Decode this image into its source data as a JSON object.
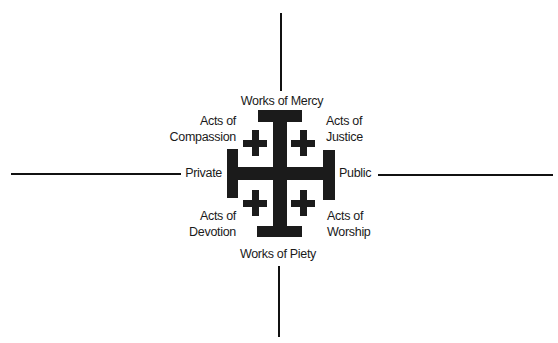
{
  "diagram": {
    "title": "",
    "colors": {
      "ink": "#1b1b1b",
      "background": "#ffffff"
    },
    "axes": {
      "vertical_top_label": "Works of Mercy",
      "vertical_bottom_label": "Works of Piety",
      "horizontal_left_label": "Private",
      "horizontal_right_label": "Public"
    },
    "quadrants": {
      "top_left": {
        "line1": "Acts of",
        "line2": "Compassion"
      },
      "top_right": {
        "line1": "Acts of",
        "line2": "Justice"
      },
      "bottom_left": {
        "line1": "Acts of",
        "line2": "Devotion"
      },
      "bottom_right": {
        "line1": "Acts of",
        "line2": "Worship"
      }
    },
    "center_symbol": "jerusalem-cross-icon"
  }
}
